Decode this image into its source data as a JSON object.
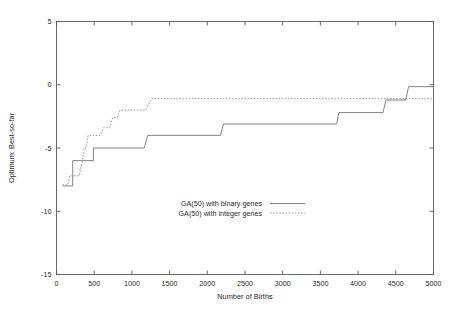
{
  "chart_data": {
    "type": "line",
    "title": "",
    "xlabel": "Number of Births",
    "ylabel": "Optimum: Best-so-far",
    "xlim": [
      0,
      5000
    ],
    "ylim": [
      -15,
      5
    ],
    "xticks": [
      0,
      500,
      1000,
      1500,
      2000,
      2500,
      3000,
      3500,
      4000,
      4500,
      5000
    ],
    "xticklabels": [
      "0",
      "500",
      "1000",
      "1500",
      "2000",
      "2500",
      "3000",
      "3500",
      "4000",
      "4500",
      "5000"
    ],
    "yticks": [
      5,
      0,
      -5,
      -10,
      -15
    ],
    "yticklabels": [
      "5",
      "0",
      "-5",
      "-10",
      "-15"
    ],
    "grid": false,
    "legend_position": "inside-lower-center",
    "series": [
      {
        "name": "GA(50) with binary genes",
        "style": "solid",
        "color": "#6e6e6e",
        "points": [
          [
            80,
            -8.0
          ],
          [
            215,
            -8.0
          ],
          [
            215,
            -6.0
          ],
          [
            490,
            -6.0
          ],
          [
            490,
            -5.0
          ],
          [
            1165,
            -5.0
          ],
          [
            1210,
            -4.0
          ],
          [
            2175,
            -4.0
          ],
          [
            2215,
            -3.1
          ],
          [
            3715,
            -3.1
          ],
          [
            3745,
            -2.2
          ],
          [
            4330,
            -2.2
          ],
          [
            4370,
            -1.2
          ],
          [
            4630,
            -1.2
          ],
          [
            4670,
            -0.15
          ],
          [
            5000,
            -0.15
          ]
        ]
      },
      {
        "name": "GA(50) with integer genes",
        "style": "dotted",
        "color": "#8a8a8a",
        "points": [
          [
            80,
            -7.9
          ],
          [
            150,
            -7.9
          ],
          [
            175,
            -7.2
          ],
          [
            300,
            -7.2
          ],
          [
            345,
            -6.0
          ],
          [
            365,
            -5.0
          ],
          [
            390,
            -5.0
          ],
          [
            420,
            -4.0
          ],
          [
            580,
            -4.0
          ],
          [
            620,
            -3.4
          ],
          [
            705,
            -3.4
          ],
          [
            745,
            -2.6
          ],
          [
            805,
            -2.6
          ],
          [
            845,
            -2.0
          ],
          [
            1185,
            -2.0
          ],
          [
            1260,
            -1.1
          ],
          [
            5000,
            -1.1
          ]
        ]
      }
    ]
  },
  "legend": {
    "entries": [
      {
        "label": "GA(50) with binary genes",
        "style": "solid"
      },
      {
        "label": "GA(50) with integer genes",
        "style": "dotted"
      }
    ]
  },
  "colors": {
    "axis": "#5a5a5a",
    "text": "#2b2b2b",
    "binary_series": "#6e6e6e",
    "integer_series": "#8a8a8a",
    "background": "#ffffff"
  }
}
